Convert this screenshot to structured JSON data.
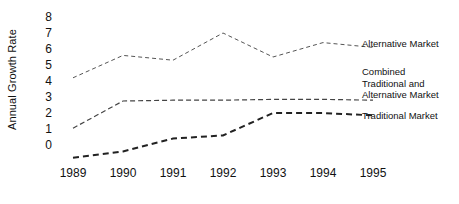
{
  "chart_data": {
    "type": "line",
    "title": "",
    "xlabel": "",
    "ylabel": "Annual Growth Rate",
    "categories": [
      "1989",
      "1990",
      "1991",
      "1992",
      "1993",
      "1994",
      "1995"
    ],
    "x": [
      1989,
      1990,
      1991,
      1992,
      1993,
      1994,
      1995
    ],
    "ylim": [
      -1,
      8
    ],
    "yticks": [
      8,
      7,
      6,
      5,
      4,
      3,
      2,
      1,
      0
    ],
    "xlim": [
      1989,
      1995
    ],
    "grid": false,
    "legend_position": "right-inline",
    "series": [
      {
        "name": "Alternative Market",
        "values": [
          4.2,
          5.6,
          5.3,
          7.0,
          5.5,
          6.4,
          6.1
        ],
        "style": "dashed-fine",
        "color": "#555555"
      },
      {
        "name": "Combined Traditional and Alternative Market",
        "values": [
          1.05,
          2.75,
          2.8,
          2.8,
          2.85,
          2.85,
          2.8
        ],
        "style": "dashed-medium",
        "color": "#444444"
      },
      {
        "name": "Traditional Market",
        "values": [
          -0.8,
          -0.4,
          0.4,
          0.6,
          2.0,
          2.0,
          1.85
        ],
        "style": "dashed-bold",
        "color": "#222222"
      }
    ],
    "annotations": [
      {
        "id": "alternative-market",
        "text": "Alternative Market"
      },
      {
        "id": "combined",
        "text": "Combined\nTraditional and\nAlternative Market"
      },
      {
        "id": "traditional-market",
        "text": "Traditional Market"
      }
    ]
  },
  "axis": {
    "y_title": "Annual Growth Rate",
    "y_ticks": [
      "8",
      "7",
      "6",
      "5",
      "4",
      "3",
      "2",
      "1",
      "0"
    ],
    "x_ticks": [
      "1989",
      "1990",
      "1991",
      "1992",
      "1993",
      "1994",
      "1995"
    ]
  },
  "labels": {
    "alternative_market": "Alternative Market",
    "combined": "Combined\nTraditional and\nAlternative Market",
    "traditional_market": "Traditional Market"
  },
  "colors": {
    "background": "#ffffff",
    "text": "#111111",
    "alternative_market_line": "#555555",
    "combined_line": "#444444",
    "traditional_market_line": "#222222"
  }
}
